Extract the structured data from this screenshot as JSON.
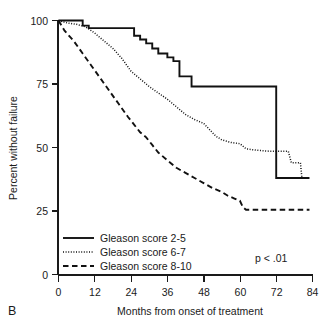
{
  "panel": {
    "label": "B"
  },
  "chart_data": {
    "type": "line",
    "title": "",
    "subtitle": "",
    "xlabel": "Months from onset of treatment",
    "ylabel": "Percent without failure",
    "xlim": [
      0,
      84
    ],
    "ylim": [
      0,
      100
    ],
    "xticks": [
      0,
      12,
      24,
      36,
      48,
      60,
      72,
      84
    ],
    "xtick_labels": [
      "0",
      "12",
      "24",
      "36",
      "48",
      "60",
      "72",
      "84"
    ],
    "yticks": [
      0,
      25,
      50,
      75,
      100
    ],
    "ytick_labels": [
      "0",
      "25",
      "50",
      "75",
      "100"
    ],
    "grid": false,
    "legend_position": "bottom-left",
    "annotations": [
      {
        "name": "p-value",
        "text": "p < .01",
        "x": 66,
        "y": 10
      }
    ],
    "series": [
      {
        "name": "Gleason score 2-5",
        "legend_label": "Gleason score 2-5",
        "style": "solid",
        "color": "#111111",
        "step": true,
        "points": [
          [
            0,
            100
          ],
          [
            8,
            100
          ],
          [
            8,
            98
          ],
          [
            10,
            98
          ],
          [
            10,
            97
          ],
          [
            25,
            97
          ],
          [
            25,
            94
          ],
          [
            27,
            94
          ],
          [
            27,
            92.5
          ],
          [
            29,
            92.5
          ],
          [
            29,
            91
          ],
          [
            31,
            91
          ],
          [
            31,
            89
          ],
          [
            33,
            89
          ],
          [
            33,
            87
          ],
          [
            36,
            87
          ],
          [
            36,
            85.5
          ],
          [
            38,
            85.5
          ],
          [
            38,
            84
          ],
          [
            40,
            84
          ],
          [
            40,
            78
          ],
          [
            44,
            78
          ],
          [
            44,
            74
          ],
          [
            72,
            74
          ],
          [
            72,
            38
          ],
          [
            83,
            38
          ]
        ]
      },
      {
        "name": "Gleason score 6-7",
        "legend_label": "Gleason score 6-7",
        "style": "dotted",
        "color": "#111111",
        "step": false,
        "points": [
          [
            0,
            100
          ],
          [
            3,
            99
          ],
          [
            6,
            98.5
          ],
          [
            9,
            97.5
          ],
          [
            12,
            95
          ],
          [
            15,
            92
          ],
          [
            18,
            89
          ],
          [
            21,
            85
          ],
          [
            24,
            80
          ],
          [
            27,
            77
          ],
          [
            30,
            74
          ],
          [
            33,
            71.5
          ],
          [
            36,
            69
          ],
          [
            39,
            66
          ],
          [
            42,
            63
          ],
          [
            45,
            61
          ],
          [
            48,
            59.5
          ],
          [
            50,
            57
          ],
          [
            52,
            54.5
          ],
          [
            54,
            53
          ],
          [
            57,
            52
          ],
          [
            60,
            51.5
          ],
          [
            62,
            49.5
          ],
          [
            65,
            49
          ],
          [
            70,
            48.5
          ],
          [
            76,
            48.5
          ],
          [
            77,
            44
          ],
          [
            80,
            44
          ],
          [
            80.5,
            38
          ],
          [
            83,
            38
          ]
        ]
      },
      {
        "name": "Gleason score 8-10",
        "legend_label": "Gleason score 8-10",
        "style": "dashed",
        "color": "#111111",
        "step": false,
        "points": [
          [
            0,
            100
          ],
          [
            2,
            96
          ],
          [
            5,
            92
          ],
          [
            8,
            87
          ],
          [
            11,
            82
          ],
          [
            14,
            77
          ],
          [
            17,
            72
          ],
          [
            20,
            67
          ],
          [
            23,
            62
          ],
          [
            25,
            59
          ],
          [
            27,
            56
          ],
          [
            29,
            54
          ],
          [
            31,
            51
          ],
          [
            33,
            48
          ],
          [
            36,
            45
          ],
          [
            39,
            42
          ],
          [
            42,
            40
          ],
          [
            45,
            38
          ],
          [
            48,
            36
          ],
          [
            51,
            34
          ],
          [
            54,
            32.5
          ],
          [
            56,
            31
          ],
          [
            58,
            30
          ],
          [
            60,
            29
          ],
          [
            61,
            26.5
          ],
          [
            62,
            25.5
          ],
          [
            83,
            25.5
          ]
        ]
      }
    ]
  },
  "legend": {
    "items": [
      {
        "label": "Gleason score 2-5",
        "style": "solid"
      },
      {
        "label": "Gleason score 6-7",
        "style": "dotted"
      },
      {
        "label": "Gleason score 8-10",
        "style": "dashed"
      }
    ]
  }
}
